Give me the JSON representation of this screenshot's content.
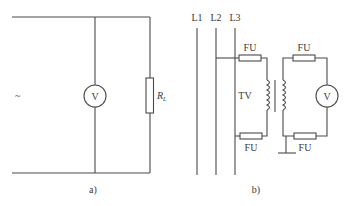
{
  "panel_a": {
    "caption": "a)",
    "source_symbol": "~",
    "voltmeter_label": "V",
    "resistor_label_main": "R",
    "resistor_label_sub": "L"
  },
  "panel_b": {
    "caption": "b)",
    "lines": [
      "L1",
      "L2",
      "L3"
    ],
    "fuse_label": "FU",
    "fuses": [
      {
        "position": "primary-top",
        "label": "FU"
      },
      {
        "position": "primary-bottom",
        "label": "FU"
      },
      {
        "position": "secondary-top",
        "label": "FU"
      },
      {
        "position": "secondary-bottom",
        "label": "FU"
      }
    ],
    "transformer_label": "TV",
    "voltmeter_label": "V"
  },
  "colors": {
    "line": "#4a4a4a",
    "text": "#3a3a3a",
    "background": "#ffffff"
  }
}
